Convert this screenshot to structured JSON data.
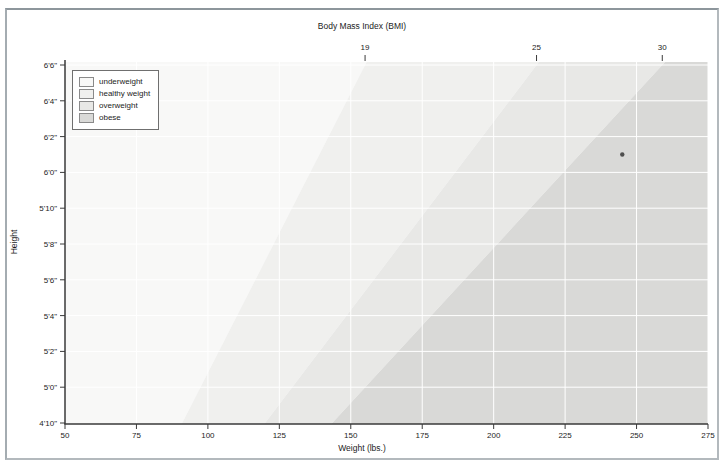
{
  "figure": {
    "top_axis_title": "Body Mass Index (BMI)",
    "xlabel": "Weight (lbs.)",
    "ylabel": "Height"
  },
  "legend": {
    "items": [
      {
        "label": "underweight",
        "color": "#f8f8f7"
      },
      {
        "label": "healthy weight",
        "color": "#f0f0ee"
      },
      {
        "label": "overweight",
        "color": "#e8e8e6"
      },
      {
        "label": "obese",
        "color": "#d9d9d7"
      }
    ]
  },
  "chart_data": {
    "type": "area",
    "title": "Body Mass Index (BMI)",
    "xlabel": "Weight (lbs.)",
    "ylabel": "Height",
    "xlim": [
      50,
      275
    ],
    "x_ticks": [
      50,
      75,
      100,
      125,
      150,
      175,
      200,
      225,
      250,
      275
    ],
    "ylim_inches": [
      58,
      78
    ],
    "y_ticks": [
      {
        "label": "4'10\"",
        "inches": 58
      },
      {
        "label": "5'0\"",
        "inches": 60
      },
      {
        "label": "5'2\"",
        "inches": 62
      },
      {
        "label": "5'4\"",
        "inches": 64
      },
      {
        "label": "5'6\"",
        "inches": 66
      },
      {
        "label": "5'8\"",
        "inches": 68
      },
      {
        "label": "5'10\"",
        "inches": 70
      },
      {
        "label": "6'0\"",
        "inches": 72
      },
      {
        "label": "6'2\"",
        "inches": 74
      },
      {
        "label": "6'4\"",
        "inches": 76
      },
      {
        "label": "6'6\"",
        "inches": 78
      }
    ],
    "top_axis": {
      "title": "Body Mass Index (BMI)",
      "ticks": [
        19,
        25,
        30
      ]
    },
    "regions": [
      {
        "name": "underweight",
        "bmi_range": "below 19",
        "color": "#f8f8f7"
      },
      {
        "name": "healthy weight",
        "bmi_range": "19 to 25",
        "color": "#f0f0ee"
      },
      {
        "name": "overweight",
        "bmi_range": "25 to 30",
        "color": "#e8e8e6"
      },
      {
        "name": "obese",
        "bmi_range": "above 30",
        "color": "#d9d9d7"
      }
    ],
    "boundaries": [
      {
        "bmi": 19,
        "weight_at_4ft10_lbs": 91,
        "weight_at_6ft6_lbs": 155
      },
      {
        "bmi": 25,
        "weight_at_4ft10_lbs": 120,
        "weight_at_6ft6_lbs": 215
      },
      {
        "bmi": 30,
        "weight_at_4ft10_lbs": 143.5,
        "weight_at_6ft6_lbs": 259
      }
    ],
    "marker": {
      "weight_lbs": 245,
      "height_inches": 73,
      "color": "#3f3f3f"
    },
    "grid": true,
    "gridline_color": "#ffffff",
    "legend_position": "upper left",
    "legend_entries": [
      "underweight",
      "healthy weight",
      "overweight",
      "obese"
    ]
  }
}
